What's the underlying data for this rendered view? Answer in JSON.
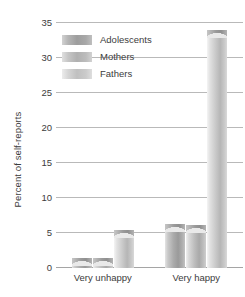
{
  "chart_data": {
    "type": "bar",
    "title": "",
    "subtitle": "",
    "xlabel": "",
    "ylabel": "Percent of self-reports",
    "categories": [
      "Very unhappy",
      "Very happy"
    ],
    "series": [
      {
        "name": "Adolescents",
        "values": [
          1.5,
          6.3
        ]
      },
      {
        "name": "Mothers",
        "values": [
          1.5,
          6.2
        ]
      },
      {
        "name": "Fathers",
        "values": [
          5.5,
          34.0
        ]
      }
    ],
    "ylim": [
      0,
      35
    ],
    "yticks": [
      0,
      5,
      10,
      15,
      20,
      25,
      30,
      35
    ],
    "ytick_labels": [
      "0",
      "5",
      "10",
      "15",
      "20",
      "25",
      "30",
      "35"
    ],
    "grid": true,
    "grid_axis": "y",
    "legend": true,
    "legend_position": "upper left inside",
    "bar_style": "3d-cylinder-gradient",
    "colors": {
      "adolescents": "#9d9d9d",
      "mothers": "#b0b0b0",
      "fathers": "#c0c0c0",
      "gridline": "#b9b9b9",
      "axis": "#a5a5a5",
      "text": "#3c3c3c",
      "background": "#ffffff"
    }
  },
  "axes": {
    "y_title": "Percent of self-reports"
  },
  "legend": {
    "items": [
      {
        "label": "Adolescents",
        "swatch": "legend-swatch-adolescents"
      },
      {
        "label": "Mothers",
        "swatch": "legend-swatch-mothers"
      },
      {
        "label": "Fathers",
        "swatch": "legend-swatch-fathers"
      }
    ]
  }
}
